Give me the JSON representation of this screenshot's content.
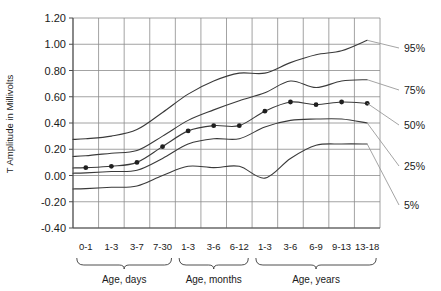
{
  "chart_data": {
    "type": "line",
    "title": "",
    "xlabel": "",
    "ylabel": "T Amplitude in Millivolts",
    "ylim": [
      -0.4,
      1.2
    ],
    "ytick_step": 0.2,
    "grid": true,
    "legend_position": "right",
    "categories": [
      "0-1",
      "1-3",
      "3-7",
      "7-30",
      "1-3",
      "3-6",
      "6-12",
      "1-3",
      "3-6",
      "6-9",
      "9-13",
      "13-18"
    ],
    "ytick_labels": [
      "1.20",
      "1.00",
      "0.80",
      "0.60",
      "0.40",
      "0.20",
      "0.00",
      "-0.20",
      "-0.40"
    ],
    "ytick_values": [
      1.2,
      1.0,
      0.8,
      0.6,
      0.4,
      0.2,
      0.0,
      -0.2,
      -0.4
    ],
    "category_groups": [
      {
        "label": "Age, days",
        "start_index": 0,
        "end_index": 3
      },
      {
        "label": "Age, months",
        "start_index": 4,
        "end_index": 6
      },
      {
        "label": "Age, years",
        "start_index": 7,
        "end_index": 11
      }
    ],
    "series": [
      {
        "name": "95%",
        "legend_label": "95%",
        "has_markers": false,
        "values": [
          0.28,
          0.3,
          0.35,
          0.48,
          0.62,
          0.72,
          0.78,
          0.78,
          0.86,
          0.92,
          0.95,
          1.03
        ]
      },
      {
        "name": "75%",
        "legend_label": "75%",
        "has_markers": false,
        "values": [
          0.15,
          0.17,
          0.19,
          0.3,
          0.42,
          0.5,
          0.57,
          0.63,
          0.72,
          0.67,
          0.72,
          0.73
        ]
      },
      {
        "name": "50%",
        "legend_label": "50%",
        "has_markers": true,
        "values": [
          0.06,
          0.07,
          0.1,
          0.22,
          0.34,
          0.38,
          0.38,
          0.49,
          0.56,
          0.54,
          0.56,
          0.55
        ]
      },
      {
        "name": "25%",
        "legend_label": "25%",
        "has_markers": false,
        "values": [
          0.02,
          0.03,
          0.04,
          0.13,
          0.24,
          0.28,
          0.28,
          0.37,
          0.42,
          0.43,
          0.43,
          0.4
        ]
      },
      {
        "name": "5%",
        "legend_label": "5%",
        "has_markers": false,
        "values": [
          -0.1,
          -0.09,
          -0.08,
          0.0,
          0.07,
          0.06,
          0.07,
          -0.02,
          0.13,
          0.23,
          0.24,
          0.24
        ]
      }
    ],
    "colors": {
      "line": "#3a3a3a",
      "grid": "#8c8c8c",
      "axis": "#4d4d4d",
      "marker": "#1f1f1f",
      "text": "#1a1a1a",
      "background": "#ffffff"
    }
  }
}
